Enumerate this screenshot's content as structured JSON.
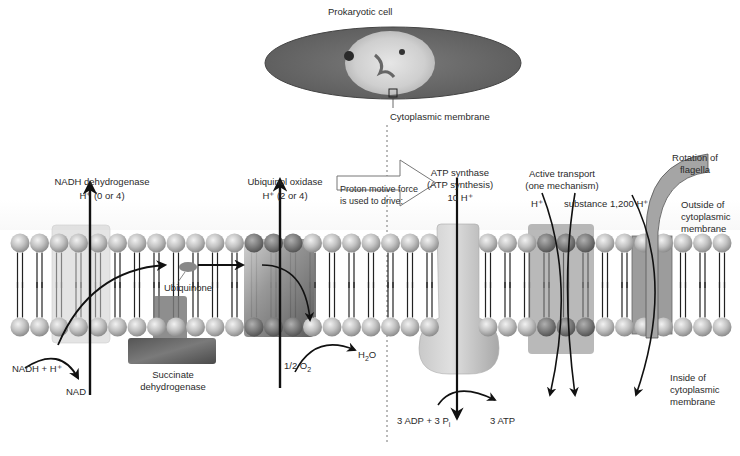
{
  "cell": {
    "title": "Prokaryotic cell",
    "membrane_callout": "Cytoplasmic membrane"
  },
  "complexes": {
    "nadh_dehydrogenase": {
      "name": "NADH dehydrogenase",
      "protons": "H⁺ (0 or 4)"
    },
    "ubiquinol_oxidase": {
      "name": "Ubiquinol oxidase",
      "protons": "H⁺ (2 or 4)"
    },
    "ubiquinone": {
      "name": "Ubiquinone"
    },
    "succinate_dehydrogenase": {
      "line1": "Succinate",
      "line2": "dehydrogenase"
    },
    "atp_synthase": {
      "line1": "ATP synthase",
      "line2": "(ATP synthesis)",
      "protons": "10 H⁺"
    },
    "active_transport": {
      "line1": "Active transport",
      "line2": "(one mechanism)",
      "proton": "H⁺",
      "substance": "substance"
    },
    "flagella": {
      "line1": "Rotation of",
      "line2": "flagella",
      "protons": "1,200 H⁺"
    }
  },
  "pmf_arrow": {
    "line1": "Proton motive force",
    "line2": "is used to drive:"
  },
  "reactions": {
    "nadh_in": "NADH + H⁺",
    "nad_out": "NAD",
    "oxygen_in": "1/2 O",
    "oxygen_sub": "2",
    "water_out_h": "H",
    "water_out_sub": "2",
    "water_out_o": "O",
    "adp_in": "3 ADP + 3 P",
    "adp_sub": "i",
    "atp_out": "3 ATP"
  },
  "sides": {
    "outside": {
      "line1": "Outside of",
      "line2": "cytoplasmic",
      "line3": "membrane"
    },
    "inside": {
      "line1": "Inside of",
      "line2": "cytoplasmic",
      "line3": "membrane"
    }
  },
  "colors": {
    "lipid_head": "#bdbdbd",
    "protein_light": "#d6d6d6",
    "protein_mid": "#9a9a9a",
    "protein_dark": "#6e6e6e",
    "arrow": "#111111"
  }
}
